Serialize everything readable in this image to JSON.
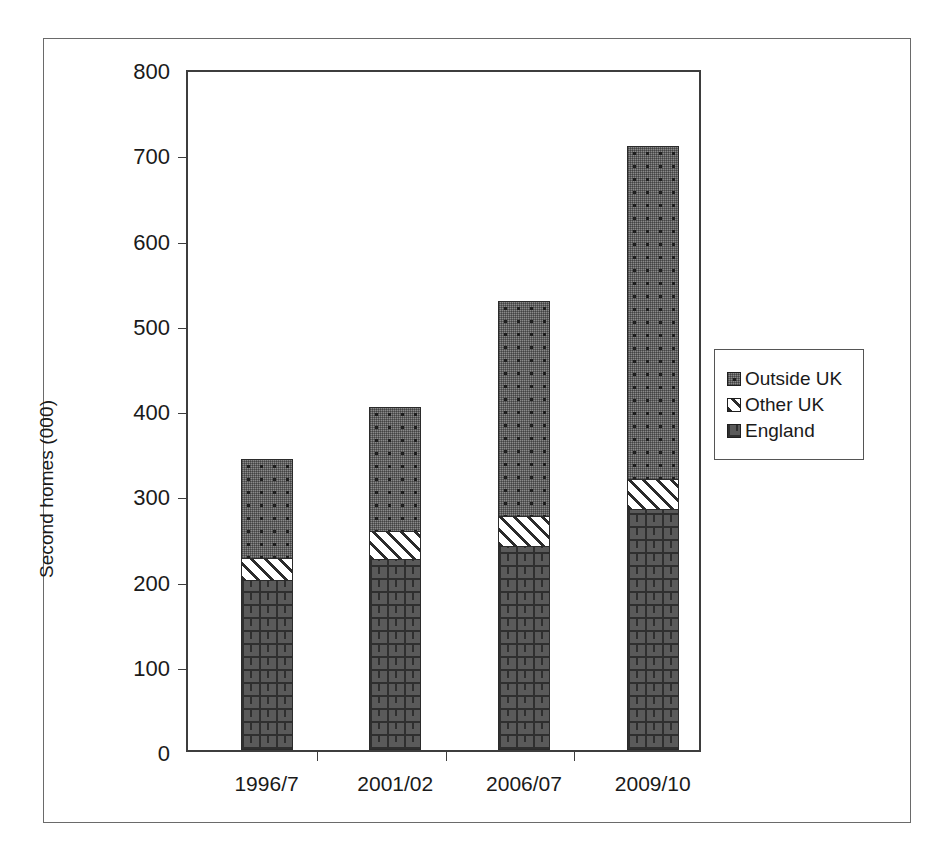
{
  "chart_data": {
    "type": "bar",
    "subtype": "stacked",
    "title": "",
    "xlabel": "",
    "ylabel": "Second homes (000)",
    "ylim": [
      0,
      800
    ],
    "yticks": [
      0,
      100,
      200,
      300,
      400,
      500,
      600,
      700,
      800
    ],
    "ytick_labels": [
      "0",
      "100",
      "200",
      "300",
      "400",
      "500",
      "600",
      "700",
      "800"
    ],
    "grid": false,
    "legend_position": "right",
    "categories": [
      "1996/7",
      "2001/02",
      "2006/07",
      "2009/10"
    ],
    "series": [
      {
        "name": "England",
        "values": [
          200,
          224,
          239,
          283
        ],
        "pattern": "brick",
        "color": "#5a5a5a"
      },
      {
        "name": "Other UK",
        "values": [
          25,
          33,
          36,
          35
        ],
        "pattern": "hatch",
        "color": "#ffffff"
      },
      {
        "name": "Outside UK",
        "values": [
          116,
          145,
          252,
          391
        ],
        "pattern": "stipple",
        "color": "#8a8a8a"
      }
    ],
    "totals": [
      341,
      402,
      527,
      709
    ]
  },
  "legend": {
    "items": [
      {
        "label": "Outside UK",
        "swatch": "stipple-swatch"
      },
      {
        "label": "Other UK",
        "swatch": "hatch-swatch"
      },
      {
        "label": "England",
        "swatch": "brick-swatch"
      }
    ]
  },
  "axes": {
    "y_title": "Second homes (000)",
    "y_labels": [
      "800",
      "700",
      "600",
      "500",
      "400",
      "300",
      "200",
      "100",
      "0"
    ],
    "x_labels": [
      "1996/7",
      "2001/02",
      "2006/07",
      "2009/10"
    ]
  }
}
